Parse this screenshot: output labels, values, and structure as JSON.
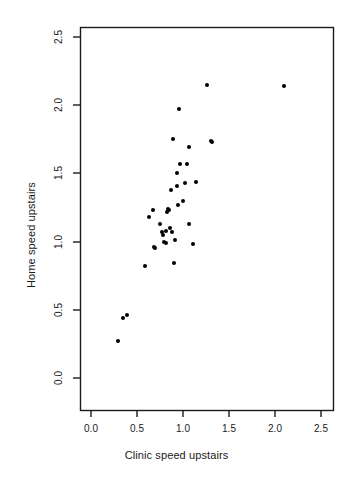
{
  "chart_data": {
    "type": "scatter",
    "title": "",
    "xlabel": "Clinic speed upstairs",
    "ylabel": "Home speed upstairs",
    "xlim": [
      -0.05,
      2.65
    ],
    "ylim": [
      -0.05,
      2.65
    ],
    "xticks": [
      "0.0",
      "0.5",
      "1.0",
      "1.5",
      "2.0",
      "2.5"
    ],
    "xtick_values": [
      0.0,
      0.5,
      1.0,
      1.5,
      2.0,
      2.5
    ],
    "yticks": [
      "0.0",
      "0.5",
      "1.0",
      "1.5",
      "2.0",
      "2.5"
    ],
    "ytick_values": [
      0.0,
      0.5,
      1.0,
      1.5,
      2.0,
      2.5
    ],
    "grid": false,
    "legend": null,
    "marker": "filled-circle",
    "marker_color": "#000000",
    "points": [
      {
        "x": 0.29,
        "y": 0.27
      },
      {
        "x": 0.35,
        "y": 0.44
      },
      {
        "x": 0.39,
        "y": 0.46
      },
      {
        "x": 0.59,
        "y": 0.82
      },
      {
        "x": 0.63,
        "y": 1.18
      },
      {
        "x": 0.67,
        "y": 1.23
      },
      {
        "x": 0.68,
        "y": 0.96
      },
      {
        "x": 0.7,
        "y": 0.95
      },
      {
        "x": 0.75,
        "y": 1.13
      },
      {
        "x": 0.77,
        "y": 1.07
      },
      {
        "x": 0.78,
        "y": 1.05
      },
      {
        "x": 0.79,
        "y": 1.0
      },
      {
        "x": 0.81,
        "y": 1.08
      },
      {
        "x": 0.82,
        "y": 0.99
      },
      {
        "x": 0.83,
        "y": 1.22
      },
      {
        "x": 0.84,
        "y": 1.24
      },
      {
        "x": 0.85,
        "y": 1.23
      },
      {
        "x": 0.86,
        "y": 1.1
      },
      {
        "x": 0.87,
        "y": 1.38
      },
      {
        "x": 0.88,
        "y": 1.07
      },
      {
        "x": 0.89,
        "y": 1.75
      },
      {
        "x": 0.9,
        "y": 0.84
      },
      {
        "x": 0.91,
        "y": 1.01
      },
      {
        "x": 0.93,
        "y": 1.41
      },
      {
        "x": 0.94,
        "y": 1.5
      },
      {
        "x": 0.95,
        "y": 1.27
      },
      {
        "x": 0.96,
        "y": 1.97
      },
      {
        "x": 0.97,
        "y": 1.57
      },
      {
        "x": 1.0,
        "y": 1.3
      },
      {
        "x": 1.02,
        "y": 1.43
      },
      {
        "x": 1.04,
        "y": 1.57
      },
      {
        "x": 1.06,
        "y": 1.13
      },
      {
        "x": 1.07,
        "y": 1.69
      },
      {
        "x": 1.11,
        "y": 0.98
      },
      {
        "x": 1.14,
        "y": 1.44
      },
      {
        "x": 1.26,
        "y": 2.15
      },
      {
        "x": 1.3,
        "y": 1.74
      },
      {
        "x": 1.32,
        "y": 1.73
      },
      {
        "x": 2.1,
        "y": 2.14
      }
    ]
  }
}
